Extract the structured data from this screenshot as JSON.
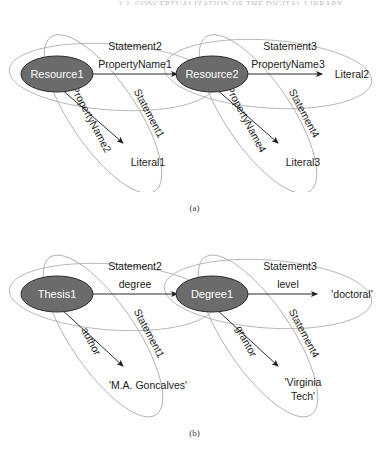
{
  "header": {
    "running_head": "2.2. CONCEPTUALIZATION OF THE DIGITAL LIBRARY"
  },
  "figures": [
    {
      "id": "a",
      "caption": "(a)",
      "nodes": [
        {
          "id": "subject1",
          "label": "Resource1",
          "type": "resource"
        },
        {
          "id": "subject2",
          "label": "Resource2",
          "type": "resource"
        },
        {
          "id": "object1",
          "label": "Literal1",
          "type": "literal"
        },
        {
          "id": "object2",
          "label": "Literal2",
          "type": "literal"
        },
        {
          "id": "object3",
          "label": "Literal3",
          "type": "literal"
        }
      ],
      "edges": [
        {
          "id": "e1",
          "label": "PropertyName1",
          "from": "subject1",
          "to": "subject2"
        },
        {
          "id": "e2",
          "label": "PropertyName2",
          "from": "subject1",
          "to": "object1"
        },
        {
          "id": "e3",
          "label": "PropertyName3",
          "from": "subject2",
          "to": "object2"
        },
        {
          "id": "e4",
          "label": "PropertyName4",
          "from": "subject2",
          "to": "object3"
        }
      ],
      "statements": [
        {
          "id": "s1",
          "label": "Statement1",
          "covers": "subject1-PropertyName2-Literal1"
        },
        {
          "id": "s2",
          "label": "Statement2",
          "covers": "subject1-PropertyName1-Resource2"
        },
        {
          "id": "s3",
          "label": "Statement3",
          "covers": "Resource2-PropertyName3-Literal2"
        },
        {
          "id": "s4",
          "label": "Statement4",
          "covers": "Resource2-PropertyName4-Literal3"
        }
      ]
    },
    {
      "id": "b",
      "caption": "(b)",
      "nodes": [
        {
          "id": "subject1",
          "label": "Thesis1",
          "type": "resource"
        },
        {
          "id": "subject2",
          "label": "Degree1",
          "type": "resource"
        },
        {
          "id": "object1",
          "label": "'M.A. Goncalves'",
          "type": "literal",
          "lines": [
            "'M.A. Goncalves'"
          ]
        },
        {
          "id": "object2",
          "label": "'doctoral'",
          "type": "literal",
          "lines": [
            "'doctoral'"
          ]
        },
        {
          "id": "object3",
          "label": "'Virginia Tech'",
          "type": "literal",
          "lines": [
            "'Virginia",
            "Tech'"
          ]
        }
      ],
      "edges": [
        {
          "id": "e1",
          "label": "degree",
          "from": "subject1",
          "to": "subject2"
        },
        {
          "id": "e2",
          "label": "author",
          "from": "subject1",
          "to": "object1"
        },
        {
          "id": "e3",
          "label": "level",
          "from": "subject2",
          "to": "object2"
        },
        {
          "id": "e4",
          "label": "grantor",
          "from": "subject2",
          "to": "object3"
        }
      ],
      "statements": [
        {
          "id": "s1",
          "label": "Statement1",
          "covers": "Thesis1-author-M.A. Goncalves"
        },
        {
          "id": "s2",
          "label": "Statement2",
          "covers": "Thesis1-degree-Degree1"
        },
        {
          "id": "s3",
          "label": "Statement3",
          "covers": "Degree1-level-doctoral"
        },
        {
          "id": "s4",
          "label": "Statement4",
          "covers": "Degree1-grantor-Virginia Tech"
        }
      ]
    }
  ],
  "colors": {
    "node_fill": "#6b6b6b",
    "node_text": "#ffffff",
    "statement_outline": "#a7a7a7",
    "edge": "#2b2b2b",
    "text": "#1b1b1b",
    "background": "#ffffff"
  }
}
